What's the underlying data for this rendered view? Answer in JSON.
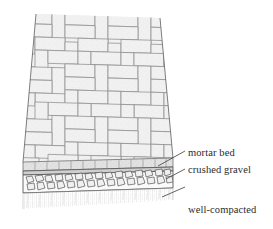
{
  "figure": {
    "view": "axonometric cutaway",
    "background_color": "#ffffff",
    "ink_color": "#4a4a4a",
    "caption": ""
  },
  "surface": {
    "name": "herringbone brick paving",
    "pattern": "herringbone",
    "brick_fill": "#efefef",
    "joint_color": "#9a9a9a",
    "edge_course_fill": "#e6e6e6"
  },
  "layers": [
    {
      "id": "mortar",
      "label": "mortar bed",
      "fill": "#dcdcdc",
      "leader": {
        "x1": 186,
        "y1": 152,
        "x2": 158,
        "y2": 165
      }
    },
    {
      "id": "gravel",
      "label": "crushed gravel",
      "fill": "#f4f4f4",
      "leader": {
        "x1": 186,
        "y1": 169,
        "x2": 163,
        "y2": 179
      }
    },
    {
      "id": "soil",
      "label": "well-compacted\nnative soil",
      "label_line1": "well-compacted",
      "label_line2": "native soil",
      "fill": "#fbfbfb",
      "leader": {
        "x1": 186,
        "y1": 188,
        "x2": 160,
        "y2": 198
      }
    }
  ],
  "labels": {
    "mortar_bed": "mortar bed",
    "crushed_gravel": "crushed gravel",
    "well_compacted_line1": "well-compacted",
    "well_compacted_line2": "native soil"
  }
}
